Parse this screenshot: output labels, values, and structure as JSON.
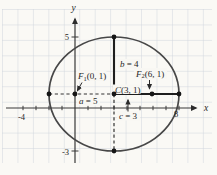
{
  "colors": {
    "background": "#faf9f5",
    "grid": "#ccd3db",
    "ink": "#2b2b2b",
    "label_bg": "#f8f7f3"
  },
  "axes": {
    "x_label": "x",
    "y_label": "y"
  },
  "tick_labels": {
    "y_top": "5",
    "y_bottom": "-3",
    "x_left": "-4",
    "x_right": "8"
  },
  "labels": {
    "f1": {
      "var": "F",
      "sub": "1",
      "coords": "(0, 1)"
    },
    "f2": {
      "var": "F",
      "sub": "2",
      "coords": "(6, 1)"
    },
    "center": {
      "var": "C",
      "coords": "(3, 1)"
    },
    "semi_major": {
      "var": "a",
      "rest": " = 5"
    },
    "semi_minor": {
      "var": "b",
      "rest": " = 4"
    },
    "focal": {
      "var": "c",
      "rest": " = 3"
    }
  },
  "geometry": {
    "center": [
      3,
      1
    ],
    "a": 5,
    "b": 4,
    "c": 3,
    "foci": [
      [
        0,
        1
      ],
      [
        6,
        1
      ]
    ],
    "vertices": [
      [
        -2,
        1
      ],
      [
        8,
        1
      ]
    ],
    "co_vertices": [
      [
        3,
        5
      ],
      [
        3,
        -3
      ]
    ]
  }
}
